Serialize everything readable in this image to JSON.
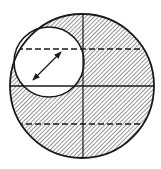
{
  "diagram": {
    "type": "geometric-section",
    "colors": {
      "background": "#ffffff",
      "stroke": "#1a1a1a",
      "hatch": "#2a2a2a",
      "cutout": "#ffffff"
    },
    "outer_circle": {
      "cx": 82,
      "cy": 86,
      "r": 72
    },
    "inner_circle": {
      "cx": 49,
      "cy": 62,
      "r": 35
    },
    "vertical_line": {
      "x": 83,
      "y1": 14,
      "y2": 158
    },
    "horizontal_line": {
      "y": 86,
      "x1": 10,
      "x2": 154
    },
    "dashed_lines": [
      {
        "y": 49,
        "label": "upper-dashed-chord"
      },
      {
        "y": 124,
        "label": "lower-dashed-chord"
      }
    ],
    "arrow": {
      "x1": 33,
      "y1": 80,
      "x2": 61,
      "y2": 52,
      "double_headed": true
    },
    "hatch": {
      "angle_deg": 45,
      "spacing": 3
    }
  }
}
